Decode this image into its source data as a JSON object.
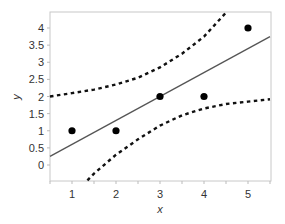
{
  "chart_data": {
    "type": "scatter",
    "title": "",
    "xlabel": "x",
    "ylabel": "y",
    "xlim": [
      0.5,
      5.5
    ],
    "ylim": [
      -0.5,
      4.5
    ],
    "x_ticks": [
      "1",
      "2",
      "3",
      "4",
      "5"
    ],
    "y_ticks": [
      "0",
      "0.5",
      "1",
      "1.5",
      "2",
      "2.5",
      "3",
      "3.5",
      "4"
    ],
    "grid": false,
    "legend": "none",
    "series": [
      {
        "name": "observations",
        "type": "scatter",
        "x": [
          1,
          2,
          3,
          4,
          5
        ],
        "y": [
          1,
          1,
          2,
          2,
          4
        ]
      },
      {
        "name": "fitted line",
        "type": "line",
        "style": "solid",
        "intercept": -0.1,
        "slope": 0.7
      },
      {
        "name": "upper band",
        "type": "line",
        "style": "dotted",
        "x": [
          0.5,
          1,
          1.5,
          2,
          2.5,
          3,
          3.5,
          4,
          4.5
        ],
        "y": [
          2.0,
          2.1,
          2.2,
          2.35,
          2.55,
          2.85,
          3.25,
          3.75,
          4.45
        ]
      },
      {
        "name": "lower band",
        "type": "line",
        "style": "dotted",
        "x": [
          1.35,
          1.5,
          2,
          2.5,
          3,
          3.5,
          4,
          4.5,
          5,
          5.5
        ],
        "y": [
          -0.45,
          -0.25,
          0.3,
          0.75,
          1.15,
          1.45,
          1.65,
          1.78,
          1.85,
          1.92
        ]
      }
    ]
  }
}
